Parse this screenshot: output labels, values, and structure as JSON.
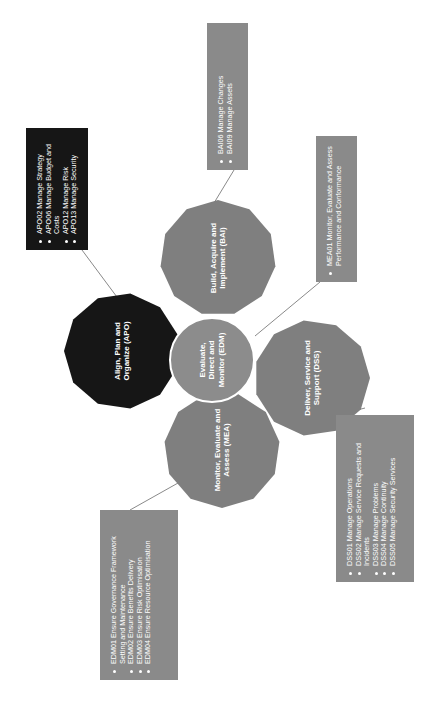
{
  "colors": {
    "apo": "#161616",
    "gray_node": "#7f7f7f",
    "box_gray": "#8a8a8a",
    "center": "#8c8c8c",
    "text": "#ffffff",
    "connector": "#6b6b6b"
  },
  "center": {
    "label": "Evaluate, Direct and Monitor (EDM)"
  },
  "domains": [
    {
      "id": "apo",
      "label": "Align, Plan and Organize (APO)",
      "items": [
        "APO02 Manage Strategy",
        "APO06 Manage Budget and Costs",
        "APO12 Manage Risk",
        "APO13 Manage Security"
      ]
    },
    {
      "id": "bai",
      "label": "Build, Acquire and Implement (BAI)",
      "items": [
        "BAI06 Manage Changes",
        "BAI09 Manage Assets"
      ]
    },
    {
      "id": "dss",
      "label": "Deliver, Service and Support (DSS)",
      "items": [
        "DSS01 Manage Operations",
        "DSS02 Manage Service Requests and Incidents",
        "DSS03 Manage Problems",
        "DSS04 Manage Continuity",
        "DSS05 Manage Security Services"
      ]
    },
    {
      "id": "mea",
      "label": "Monitor, Evaluate and Assess (MEA)",
      "items": [
        "MEA01 Monitor, Evaluate and Assess Performance and Conformance"
      ]
    },
    {
      "id": "edm",
      "label": "Evaluate, Direct and Monitor (EDM)",
      "items": [
        "EDM01 Ensure Governance Framework Setting and Maintenance",
        "EDM02 Ensure Benefits Delivery",
        "EDM03 Ensure Risk Optimisation",
        "EDM04 Ensure Resource Optimisation"
      ]
    }
  ]
}
